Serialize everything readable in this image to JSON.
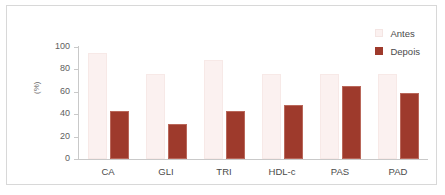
{
  "chart_data": {
    "type": "bar",
    "title": "",
    "subtitle": "",
    "xlabel": "",
    "ylabel": "(%)",
    "ylim": [
      0,
      100
    ],
    "yticks": [
      0,
      20,
      40,
      60,
      80,
      100
    ],
    "grid": false,
    "legend_position": "top-right",
    "categories": [
      "CA",
      "GLI",
      "TRI",
      "HDL-c",
      "PAS",
      "PAD"
    ],
    "series": [
      {
        "name": "Antes",
        "color": "#fbf1f0",
        "values": [
          95,
          76,
          88,
          76,
          76,
          76
        ]
      },
      {
        "name": "Depois",
        "color": "#9e3a2c",
        "values": [
          43,
          31,
          43,
          48,
          65,
          59
        ]
      }
    ]
  },
  "legend": {
    "items": [
      {
        "label": "Antes",
        "swatch_class": "sw-antes"
      },
      {
        "label": "Depois",
        "swatch_class": "sw-depois"
      }
    ]
  },
  "axis": {
    "y_title": "(%)"
  },
  "colors": {
    "bar_antes": "#fbf1f0",
    "bar_depois": "#9e3a2c",
    "axis_line": "#c9c9c9",
    "frame": "#d8d8d8",
    "tick_text": "#5e5e5e",
    "category_text": "#4a4a4a"
  }
}
